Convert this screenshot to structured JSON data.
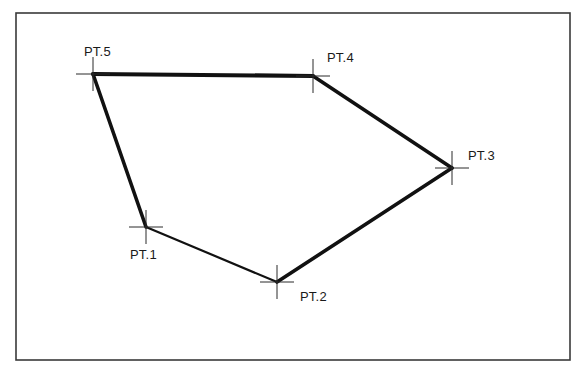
{
  "diagram": {
    "type": "polygon-traverse",
    "frame": {
      "x1": 16,
      "y1": 13,
      "x2": 570,
      "y2": 360
    },
    "line_color": "#111111",
    "points": [
      {
        "id": "pt1",
        "label": "PT.1",
        "x": 146,
        "y": 227,
        "label_x": 130,
        "label_y": 248
      },
      {
        "id": "pt2",
        "label": "PT.2",
        "x": 277,
        "y": 282,
        "label_x": 300,
        "label_y": 290
      },
      {
        "id": "pt3",
        "label": "PT.3",
        "x": 452,
        "y": 168,
        "label_x": 468,
        "label_y": 149
      },
      {
        "id": "pt4",
        "label": "PT.4",
        "x": 313,
        "y": 76,
        "label_x": 327,
        "label_y": 51
      },
      {
        "id": "pt5",
        "label": "PT.5",
        "x": 93,
        "y": 74,
        "label_x": 84,
        "label_y": 45
      }
    ],
    "edges": [
      {
        "from": "PT.1",
        "to": "PT.2",
        "weight": 2.2
      },
      {
        "from": "PT.2",
        "to": "PT.3",
        "weight": 3.6
      },
      {
        "from": "PT.3",
        "to": "PT.4",
        "weight": 3.6
      },
      {
        "from": "PT.4",
        "to": "PT.5",
        "weight": 4.2
      },
      {
        "from": "PT.5",
        "to": "PT.1",
        "weight": 3.6
      }
    ],
    "crosshair_half_length": 17
  },
  "labels": {
    "pt1": "PT.1",
    "pt2": "PT.2",
    "pt3": "PT.3",
    "pt4": "PT.4",
    "pt5": "PT.5"
  }
}
